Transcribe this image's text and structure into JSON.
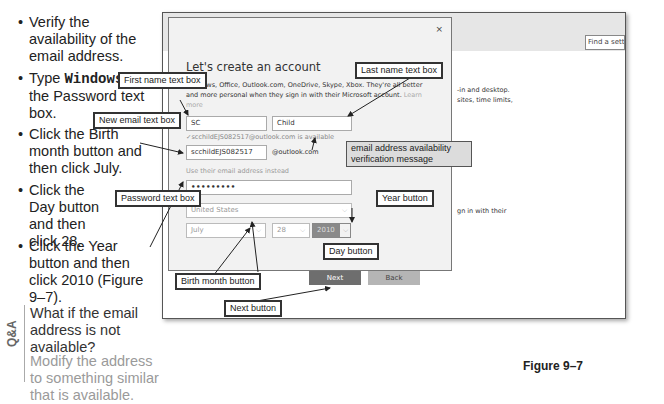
{
  "steps": {
    "cut_top": "current date.",
    "items": [
      {
        "text": "Verify the availability of the email address."
      },
      {
        "prefix": "Type ",
        "code": "Windows10",
        "suffix": " in the Password text box."
      },
      {
        "text": "Click the Birth month button and then click July."
      },
      {
        "text": "Click the Day button and then click 28."
      },
      {
        "text": "Click the Year button and then click 2010 (Figure 9–7)."
      }
    ]
  },
  "qa": {
    "label": "Q&A",
    "question": "What if the email address is not available?",
    "answer": "Modify the address to something similar that is available."
  },
  "screenshot": {
    "find_setting": "Find a setting",
    "bg_text_1": "-in and desktop.",
    "bg_text_2": "sites, time limits,",
    "bg_text_3": "gn in with their",
    "dialog": {
      "close": "×",
      "title": "Let's create an account",
      "description": "Windows, Office, Outlook.com, OneDrive, Skype, Xbox. They're all better and more personal when they sign in with their Microsoft account.",
      "learn_more": "Learn more",
      "first_name": "SC",
      "last_name": "Child",
      "availability_message": "✓scchildEJS082517@outlook.com is available",
      "email": "scchildEJS082517",
      "domain": "@outlook.com",
      "use_email": "Use their email address instead",
      "password": "•••••••••",
      "country": "United States",
      "month": "July",
      "day": "28",
      "year": "2010",
      "next": "Next",
      "back": "Back"
    }
  },
  "callouts": {
    "first_name": "First name text box",
    "last_name": "Last name text box",
    "new_email": "New email text box",
    "password": "Password text box",
    "availability": "email address availability verification message",
    "year": "Year button",
    "day": "Day button",
    "birth_month": "Birth month button",
    "next": "Next button"
  },
  "figure_caption": "Figure 9–7",
  "colors": {
    "next_button": "#6e6e6e",
    "back_button": "#b5b5b5",
    "year_button": "#8a8a8a"
  }
}
